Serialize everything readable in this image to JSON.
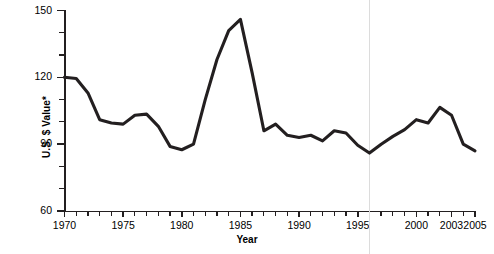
{
  "chart_data": {
    "type": "line",
    "title": "",
    "subtitle": "",
    "xlabel": "Year",
    "ylabel": "U.S. $ Value*",
    "xlim": [
      1970,
      2005
    ],
    "ylim": [
      60,
      150
    ],
    "ytick_labels": [
      "60",
      "90",
      "120",
      "150"
    ],
    "ytick_values": [
      60,
      90,
      120,
      150
    ],
    "yminor_step": 10,
    "xtick_labels": [
      "1970",
      "1975",
      "1980",
      "1985",
      "1990",
      "1995",
      "2000",
      "2003",
      "2005"
    ],
    "xtick_values": [
      1970,
      1975,
      1980,
      1985,
      1990,
      1995,
      2000,
      2003,
      2005
    ],
    "xminor_step": 1,
    "grid": "single vertical gridline at 1996",
    "gridline_x": 1996,
    "legend": "none",
    "annotations": [
      "* asterisk on y-axis label denotes footnote"
    ],
    "series": [
      {
        "name": "U.S. $ Value",
        "color": "#231f20",
        "x": [
          1970,
          1971,
          1972,
          1973,
          1974,
          1975,
          1976,
          1977,
          1978,
          1979,
          1980,
          1981,
          1982,
          1983,
          1984,
          1985,
          1986,
          1987,
          1988,
          1989,
          1990,
          1991,
          1992,
          1993,
          1994,
          1995,
          1996,
          1997,
          1998,
          1999,
          2000,
          2001,
          2002,
          2003,
          2004,
          2005
        ],
        "values": [
          120,
          119.5,
          113,
          101,
          99.5,
          99,
          103,
          103.5,
          98,
          89,
          87.5,
          90,
          110,
          128,
          141,
          146,
          122,
          96,
          99,
          94,
          93,
          94,
          91.5,
          96,
          95,
          89.5,
          86,
          90,
          93.5,
          96.5,
          101,
          99.5,
          106.5,
          103,
          90,
          87
        ]
      }
    ]
  }
}
